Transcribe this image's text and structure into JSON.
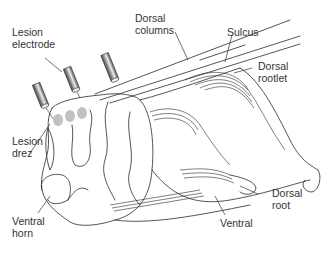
{
  "figure": {
    "colors": {
      "line": "#2a2a2a",
      "lesion": "#bdbdbd",
      "electrode_dark": "#555555",
      "electrode_light": "#dddddd",
      "background": "#ffffff"
    }
  },
  "labels": {
    "lesion_electrode": "Lesion\nelectrode",
    "dorsal_columns": "Dorsal\ncolumns",
    "sulcus": "Sulcus",
    "dorsal_rootlet": "Dorsal\nrootlet",
    "lesion_drez": "Lesion\ndrez",
    "ventral_horn": "Ventral\nhorn",
    "dorsal_root": "Dorsal\nroot",
    "ventral": "Ventral"
  }
}
